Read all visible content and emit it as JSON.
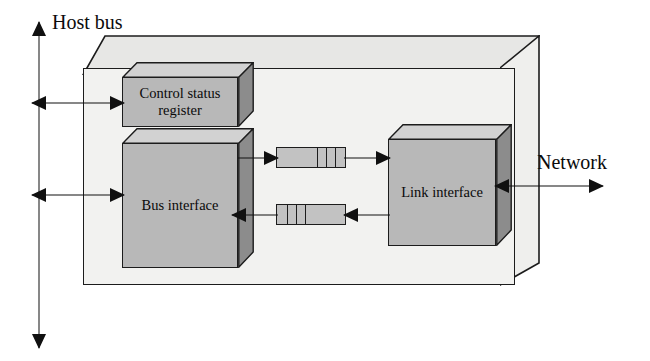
{
  "diagram": {
    "enclosure": {
      "name": "network-interface-card"
    },
    "blocks": [
      {
        "id": "control-status-register",
        "label": "Control status\nregister",
        "label_line1": "Control status",
        "label_line2": "register"
      },
      {
        "id": "bus-interface",
        "label": "Bus interface"
      },
      {
        "id": "link-interface",
        "label": "Link interface"
      }
    ],
    "buffers": [
      {
        "id": "outgoing-fifo",
        "label": "",
        "cells": 3,
        "direction": "right"
      },
      {
        "id": "incoming-fifo",
        "label": "",
        "cells": 3,
        "direction": "left"
      }
    ],
    "external": {
      "host_bus_label": "Host bus",
      "network_label": "Network"
    },
    "connections": [
      {
        "id": "hostbus-to-csr",
        "from": "host-bus",
        "to": "control-status-register",
        "direction": "bidirectional"
      },
      {
        "id": "hostbus-to-bus-interface",
        "from": "host-bus",
        "to": "bus-interface",
        "direction": "bidirectional"
      },
      {
        "id": "bus-interface-to-outgoing-fifo",
        "from": "bus-interface",
        "to": "outgoing-fifo",
        "direction": "right"
      },
      {
        "id": "outgoing-fifo-to-link-interface",
        "from": "outgoing-fifo",
        "to": "link-interface",
        "direction": "right"
      },
      {
        "id": "link-interface-to-incoming-fifo",
        "from": "link-interface",
        "to": "incoming-fifo",
        "direction": "left"
      },
      {
        "id": "incoming-fifo-to-bus-interface",
        "from": "incoming-fifo",
        "to": "bus-interface",
        "direction": "left"
      },
      {
        "id": "network-to-link-interface",
        "from": "network",
        "to": "link-interface",
        "direction": "bidirectional"
      }
    ]
  },
  "colors": {
    "block_fill": "#b8b8b8",
    "block_top": "#d0d0d0",
    "block_side": "#8f8f8f",
    "enclosure_fill": "#f2f2f0",
    "enclosure_top": "#e4e4e2",
    "enclosure_side": "#ededeb",
    "buffer_fill": "#c2c2c2",
    "stroke": "#1c1c1c",
    "arrow": "#101010",
    "text": "#0a0a0a"
  }
}
